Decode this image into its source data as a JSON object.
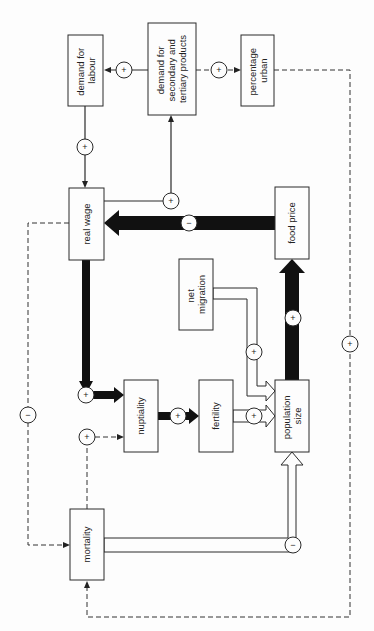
{
  "diagram": {
    "type": "causal-loop-diagram",
    "orientation": "rotated 90 degrees (text reads bottom-to-top)",
    "nodes": [
      {
        "id": "demand_labour",
        "lines": [
          "demand for",
          "labour"
        ]
      },
      {
        "id": "demand_products",
        "lines": [
          "demand for",
          "secondary and",
          "tertiary products"
        ]
      },
      {
        "id": "percentage_urban",
        "lines": [
          "percentage",
          "urban"
        ]
      },
      {
        "id": "real_wage",
        "lines": [
          "real wage"
        ]
      },
      {
        "id": "food_price",
        "lines": [
          "food price"
        ]
      },
      {
        "id": "net_migration",
        "lines": [
          "net",
          "migration"
        ]
      },
      {
        "id": "nuptiality",
        "lines": [
          "nuptiality"
        ]
      },
      {
        "id": "fertility",
        "lines": [
          "fertility"
        ]
      },
      {
        "id": "population_size",
        "lines": [
          "population",
          "size"
        ]
      },
      {
        "id": "mortality",
        "lines": [
          "mortality"
        ]
      }
    ],
    "edges": [
      {
        "from": "demand_products",
        "to": "demand_labour",
        "sign": "+",
        "style": "thin"
      },
      {
        "from": "demand_products",
        "to": "percentage_urban",
        "sign": "+",
        "style": "dashed"
      },
      {
        "from": "demand_labour",
        "to": "real_wage",
        "sign": "+",
        "style": "thin"
      },
      {
        "from": "real_wage",
        "to": "demand_products",
        "sign": "+",
        "style": "thin"
      },
      {
        "from": "food_price",
        "to": "real_wage",
        "sign": "−",
        "style": "thick"
      },
      {
        "from": "population_size",
        "to": "food_price",
        "sign": "+",
        "style": "thick"
      },
      {
        "from": "real_wage",
        "to": "nuptiality",
        "sign": "+",
        "style": "thick"
      },
      {
        "from": "nuptiality",
        "to": "fertility",
        "sign": "+",
        "style": "thick"
      },
      {
        "from": "fertility",
        "to": "population_size",
        "sign": "+",
        "style": "hollow"
      },
      {
        "from": "net_migration",
        "to": "population_size",
        "sign": "+",
        "style": "hollow"
      },
      {
        "from": "mortality",
        "to": "population_size",
        "sign": "−",
        "style": "hollow"
      },
      {
        "from": "real_wage",
        "to": "mortality",
        "sign": "−",
        "style": "dashed"
      },
      {
        "from": "mortality",
        "to": "nuptiality",
        "sign": "+",
        "style": "dashed"
      },
      {
        "from": "percentage_urban",
        "to": "mortality",
        "sign": "+",
        "style": "dashed"
      }
    ],
    "signs": {
      "plus": "+",
      "minus": "−"
    }
  }
}
